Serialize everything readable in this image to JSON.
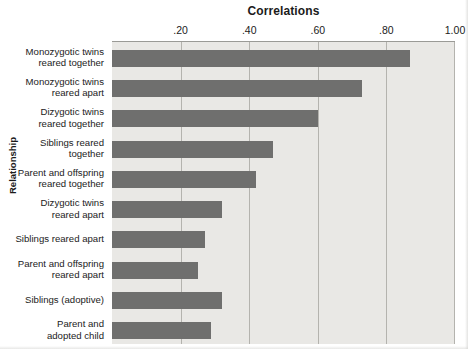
{
  "chart_data": {
    "type": "bar",
    "orientation": "horizontal",
    "title": "Correlations",
    "xlabel": "Correlations",
    "ylabel": "Relationship",
    "xlim": [
      0.0,
      1.0
    ],
    "grid": true,
    "legend": null,
    "xtick_labels": [
      ".20",
      ".40",
      ".60",
      ".80",
      "1.00"
    ],
    "xtick_values": [
      0.2,
      0.4,
      0.6,
      0.8,
      1.0
    ],
    "categories": [
      "Monozygotic twins reared together",
      "Monozygotic twins reared apart",
      "Dizygotic twins reared together",
      "Siblings reared together",
      "Parent and offspring reared together",
      "Dizygotic twins reared apart",
      "Siblings reared apart",
      "Parent and offspring reared apart",
      "Siblings (adoptive)",
      "Parent and adopted child"
    ],
    "category_lines": [
      [
        "Monozygotic twins",
        "reared together"
      ],
      [
        "Monozygotic twins",
        "reared apart"
      ],
      [
        "Dizygotic twins",
        "reared together"
      ],
      [
        "Siblings reared",
        "together"
      ],
      [
        "Parent and offspring",
        "reared together"
      ],
      [
        "Dizygotic twins",
        "reared apart"
      ],
      [
        "Siblings reared apart"
      ],
      [
        "Parent and offspring",
        "reared apart"
      ],
      [
        "Siblings (adoptive)"
      ],
      [
        "Parent and",
        "adopted child"
      ]
    ],
    "values": [
      0.87,
      0.73,
      0.6,
      0.47,
      0.42,
      0.32,
      0.27,
      0.25,
      0.32,
      0.29
    ]
  },
  "colors": {
    "bar": "#6f6f6e",
    "plot_background": "#e9e8e5",
    "gridline": "#b4b3ae",
    "axis": "#9a9a96",
    "text": "#1b1b1b",
    "page_background": "#ffffff"
  }
}
